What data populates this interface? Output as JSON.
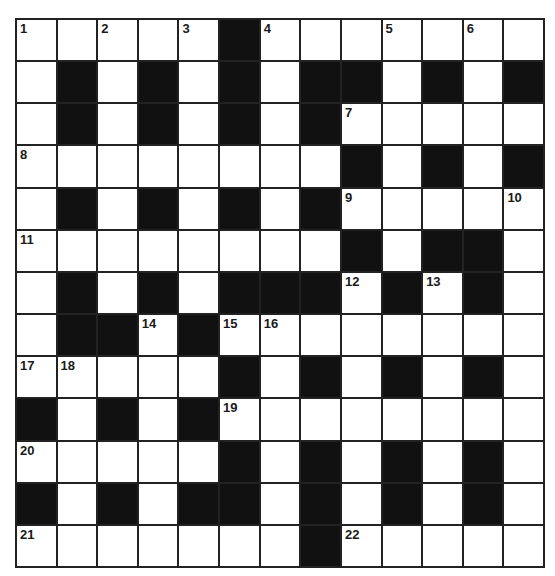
{
  "puzzle": {
    "type": "crossword",
    "rows": 13,
    "cols": 13,
    "colors": {
      "block": "#111111",
      "cell": "#ffffff",
      "line": "#222222",
      "number": "#1a1a1a"
    },
    "layout": [
      "WWWWWBWWWWWWW",
      "WBWBWBWBBWBWB",
      "WBWBWBWBWWWWW",
      "WWWWWWWWBWBWB",
      "WBWBWBWBWWWWW",
      "WWWWWWWWBWBBW",
      "WBWBWBBBWBWBW",
      "WBBWBWWWWWWWW",
      "WWWWWBWBWBWBW",
      "BWBWBWWWWWWWW",
      "WWWWWBWBWBWBW",
      "BWBWBBWBWBWBW",
      "WWWWWWWBWWWWW"
    ],
    "numbers": [
      {
        "r": 0,
        "c": 0,
        "n": "1"
      },
      {
        "r": 0,
        "c": 2,
        "n": "2"
      },
      {
        "r": 0,
        "c": 4,
        "n": "3"
      },
      {
        "r": 0,
        "c": 6,
        "n": "4"
      },
      {
        "r": 0,
        "c": 9,
        "n": "5"
      },
      {
        "r": 0,
        "c": 11,
        "n": "6"
      },
      {
        "r": 2,
        "c": 8,
        "n": "7"
      },
      {
        "r": 3,
        "c": 0,
        "n": "8"
      },
      {
        "r": 4,
        "c": 8,
        "n": "9"
      },
      {
        "r": 4,
        "c": 12,
        "n": "10"
      },
      {
        "r": 5,
        "c": 0,
        "n": "11"
      },
      {
        "r": 6,
        "c": 8,
        "n": "12"
      },
      {
        "r": 6,
        "c": 10,
        "n": "13"
      },
      {
        "r": 7,
        "c": 3,
        "n": "14"
      },
      {
        "r": 7,
        "c": 5,
        "n": "15"
      },
      {
        "r": 7,
        "c": 6,
        "n": "16"
      },
      {
        "r": 8,
        "c": 0,
        "n": "17"
      },
      {
        "r": 8,
        "c": 1,
        "n": "18"
      },
      {
        "r": 9,
        "c": 5,
        "n": "19"
      },
      {
        "r": 10,
        "c": 0,
        "n": "20"
      },
      {
        "r": 12,
        "c": 0,
        "n": "21"
      },
      {
        "r": 12,
        "c": 8,
        "n": "22"
      }
    ]
  }
}
